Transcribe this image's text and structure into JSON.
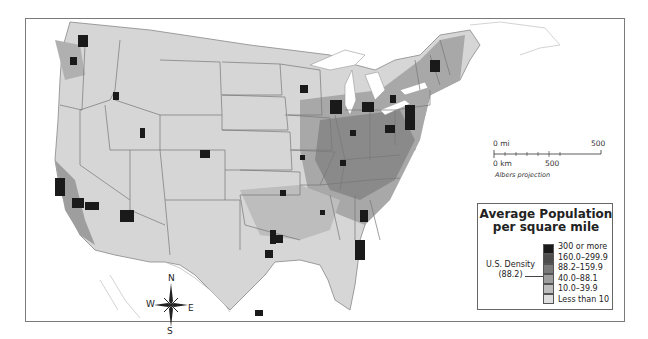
{
  "map": {
    "type": "choropleth",
    "subject": "Average population per square mile by U.S. county",
    "projection_label": "Albers projection"
  },
  "legend": {
    "title_line1": "Average Population",
    "title_line2": "per square mile",
    "classes": [
      {
        "label": "300 or more",
        "color": "#1a1a1a"
      },
      {
        "label": "160.0–299.9",
        "color": "#4d4d4d"
      },
      {
        "label": "88.2–159.9",
        "color": "#7a7a7a"
      },
      {
        "label": "40.0–88.1",
        "color": "#9e9e9e"
      },
      {
        "label": "10.0–39.9",
        "color": "#bdbdbd"
      },
      {
        "label": "Less than 10",
        "color": "#dedede"
      }
    ],
    "us_density_label": "U.S. Density",
    "us_density_value": "(88.2)"
  },
  "scale_bar": {
    "mi_start": "0 mi",
    "mi_end": "500",
    "km_start": "0 km",
    "km_end": "500",
    "projection": "Albers projection"
  },
  "compass": {
    "n": "N",
    "s": "S",
    "e": "E",
    "w": "W"
  }
}
